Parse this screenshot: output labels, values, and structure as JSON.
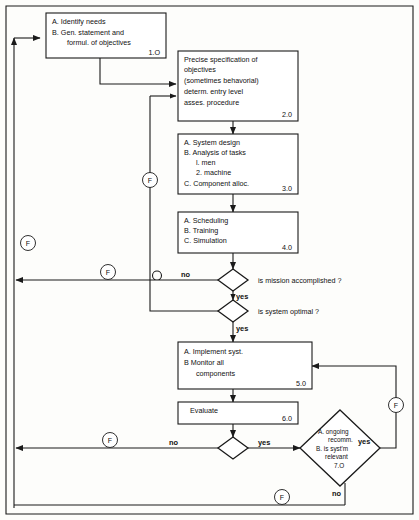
{
  "diagram": {
    "type": "flowchart",
    "colors": {
      "stroke": "#1a1a1a",
      "fill": "#ffffff",
      "background": "#fdfdfb"
    },
    "boxes": [
      {
        "id": "box-1",
        "number": "1.O",
        "lines": [
          "A. Identify needs",
          "B. Gen. statement and",
          "formul. of objectives"
        ]
      },
      {
        "id": "box-2",
        "number": "2.0",
        "lines": [
          "Precise specification of",
          "objectives",
          "(sometimes behavorial)",
          "determ. entry level",
          "asses. procedure"
        ]
      },
      {
        "id": "box-3",
        "number": "3.0",
        "lines": [
          "A. System design",
          "B. Analysis of tasks",
          "l. men",
          "2. machine",
          "C. Component alloc."
        ]
      },
      {
        "id": "box-4",
        "number": "4.0",
        "lines": [
          "A. Scheduling",
          "B. Training",
          "C. Simulation"
        ]
      },
      {
        "id": "box-5",
        "number": "5.0",
        "lines": [
          "A. Implement syst.",
          "B  Monitor all",
          "components"
        ]
      },
      {
        "id": "box-6",
        "number": "6.0",
        "lines": [
          "Evaluate"
        ]
      }
    ],
    "decisions": [
      {
        "id": "decision-mission",
        "question": "is mission accomplished ?",
        "yes": "yes",
        "no": "no"
      },
      {
        "id": "decision-optimal",
        "question": "is system optimal ?",
        "yes": "yes",
        "no": "no"
      },
      {
        "id": "decision-evaluate",
        "question": "",
        "yes": "yes",
        "no": "no"
      },
      {
        "id": "decision-relevant",
        "number": "7.O",
        "lines": [
          "A. ongoing",
          "recomm.",
          "B. is syst'm",
          "relevant"
        ],
        "yes": "yes",
        "no": "no"
      }
    ],
    "connectors": [
      {
        "id": "connector-f-1",
        "label": "F"
      },
      {
        "id": "connector-f-2",
        "label": "F"
      },
      {
        "id": "connector-f-3",
        "label": "F"
      },
      {
        "id": "connector-f-4",
        "label": "F"
      },
      {
        "id": "connector-f-5",
        "label": "F"
      },
      {
        "id": "connector-f-6",
        "label": "F"
      }
    ]
  }
}
